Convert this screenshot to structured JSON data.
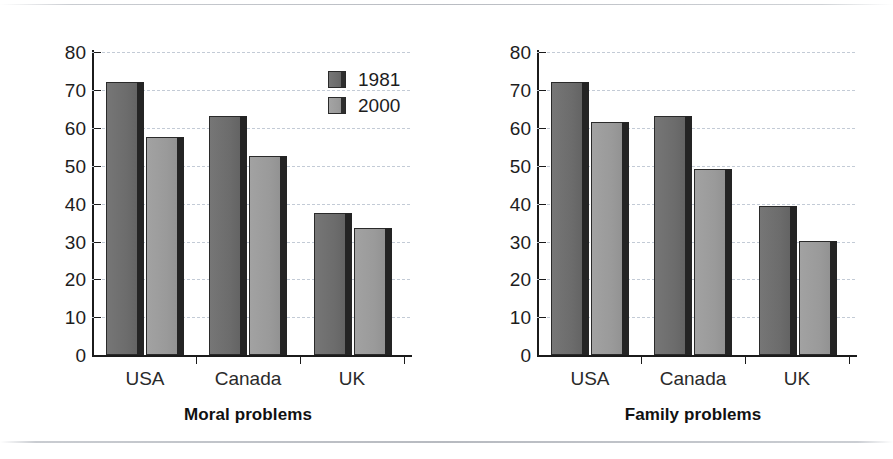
{
  "figure": {
    "background_color": "#ffffff",
    "series_colors": {
      "1981": "#6a6a6a",
      "2000": "#9a9a9a"
    },
    "grid_color": "#c3cbd6",
    "axis_color": "#1b1b1b"
  },
  "charts": [
    {
      "id": "moral-problems",
      "title": "Moral problems",
      "legend": [
        {
          "key": "1981",
          "label": "1981",
          "swatch": "dark-gray-swatch"
        },
        {
          "key": "2000",
          "label": "2000",
          "swatch": "light-gray-swatch"
        }
      ],
      "yticks": [
        "80",
        "70",
        "60",
        "50",
        "40",
        "30",
        "20",
        "10",
        "0"
      ],
      "xlabels": [
        "USA",
        "Canada",
        "UK"
      ]
    },
    {
      "id": "family-problems",
      "title": "Family problems",
      "legend": [
        {
          "key": "1981",
          "label": "1981",
          "swatch": "dark-gray-swatch"
        },
        {
          "key": "2000",
          "label": "2000",
          "swatch": "light-gray-swatch"
        }
      ],
      "yticks": [
        "80",
        "70",
        "60",
        "50",
        "40",
        "30",
        "20",
        "10",
        "0"
      ],
      "xlabels": [
        "USA",
        "Canada",
        "UK"
      ]
    }
  ],
  "chart_data": [
    {
      "type": "bar",
      "title": "Moral problems",
      "xlabel": "",
      "ylabel": "",
      "ylim": [
        0,
        80
      ],
      "ytick_step": 10,
      "grid": true,
      "grid_style": "dashed-horizontal",
      "legend_position": "upper-right-inside",
      "categories": [
        "USA",
        "Canada",
        "UK"
      ],
      "series": [
        {
          "name": "1981",
          "color": "#6a6a6a",
          "values": [
            72,
            63,
            37.5
          ]
        },
        {
          "name": "2000",
          "color": "#9a9a9a",
          "values": [
            57.5,
            52.5,
            33.5
          ]
        }
      ]
    },
    {
      "type": "bar",
      "title": "Family problems",
      "xlabel": "",
      "ylabel": "",
      "ylim": [
        0,
        80
      ],
      "ytick_step": 10,
      "grid": true,
      "grid_style": "dashed-horizontal",
      "legend_position": "upper-right-inside",
      "categories": [
        "USA",
        "Canada",
        "UK"
      ],
      "series": [
        {
          "name": "1981",
          "color": "#6a6a6a",
          "values": [
            72,
            63,
            39.3
          ]
        },
        {
          "name": "2000",
          "color": "#9a9a9a",
          "values": [
            61.5,
            49,
            30
          ]
        }
      ]
    }
  ]
}
